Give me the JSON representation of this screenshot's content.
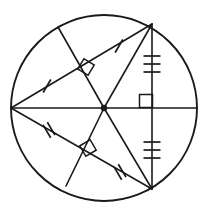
{
  "figure": {
    "type": "geometry-diagram",
    "width": 207,
    "height": 216,
    "background_color": "#ffffff",
    "stroke_color": "#1a1a1a"
  },
  "circle": {
    "name": "main-circle",
    "center_x": 104,
    "center_y": 108,
    "radius": 93,
    "label": "circle"
  },
  "center_point": {
    "name": "center-dot",
    "x": 104,
    "y": 108,
    "radius": 3.2,
    "label": "center"
  },
  "points": {
    "left": {
      "x": 11,
      "y": 108,
      "label": "left-vertex"
    },
    "right": {
      "x": 197,
      "y": 108,
      "label": "right-vertex"
    },
    "top": {
      "x": 152,
      "y": 24,
      "label": "top-vertex"
    },
    "bottom": {
      "x": 152,
      "y": 189,
      "label": "bottom-vertex"
    },
    "upper_perp_end": {
      "x": 58,
      "y": 27,
      "label": "upper-perpendicular-endpoint"
    },
    "lower_perp_end": {
      "x": 66,
      "y": 186,
      "label": "lower-perpendicular-endpoint"
    },
    "upper_foot": {
      "x": 86,
      "y": 67,
      "label": "upper-perpendicular-foot"
    },
    "lower_foot": {
      "x": 88,
      "y": 148,
      "label": "lower-perpendicular-foot"
    }
  },
  "segments": [
    {
      "name": "horizontal-diameter",
      "x1": 11,
      "y1": 108,
      "x2": 197,
      "y2": 108,
      "label": "horizontal diameter"
    },
    {
      "name": "vertical-chord",
      "x1": 152,
      "y1": 24,
      "x2": 152,
      "y2": 189,
      "label": "vertical chord"
    },
    {
      "name": "upper-chord",
      "x1": 11,
      "y1": 108,
      "x2": 152,
      "y2": 24,
      "label": "upper chord"
    },
    {
      "name": "lower-chord",
      "x1": 11,
      "y1": 108,
      "x2": 152,
      "y2": 189,
      "label": "lower chord"
    },
    {
      "name": "center-to-top-radius",
      "x1": 104,
      "y1": 108,
      "x2": 152,
      "y2": 24,
      "label": "radius to top vertex"
    },
    {
      "name": "center-to-bottom-radius",
      "x1": 104,
      "y1": 108,
      "x2": 152,
      "y2": 189,
      "label": "radius to bottom vertex"
    },
    {
      "name": "upper-perpendicular",
      "x1": 58,
      "y1": 27,
      "x2": 104,
      "y2": 108,
      "label": "upper perpendicular bisector"
    },
    {
      "name": "lower-perpendicular",
      "x1": 66,
      "y1": 186,
      "x2": 104,
      "y2": 108,
      "label": "lower perpendicular bisector"
    }
  ],
  "right_angle_marks": [
    {
      "name": "right-angle-center",
      "cx": 146,
      "cy": 101,
      "size": 13,
      "rotation": 0,
      "label": "right angle at center on vertical chord"
    },
    {
      "name": "right-angle-upper-foot",
      "cx": 86,
      "cy": 67,
      "size": 12,
      "rotation": 30.8,
      "label": "right angle at upper chord foot"
    },
    {
      "name": "right-angle-lower-foot",
      "cx": 88,
      "cy": 148,
      "size": 12,
      "rotation": -30.5,
      "label": "right angle at lower chord foot"
    }
  ],
  "tick_marks": [
    {
      "name": "tick-vertical-upper",
      "count": 3,
      "x": 152,
      "y": 64,
      "angle": 90,
      "length": 17,
      "spacing": 8,
      "label": "three ticks upper vertical chord half"
    },
    {
      "name": "tick-vertical-lower",
      "count": 3,
      "x": 152,
      "y": 150,
      "angle": 90,
      "length": 17,
      "spacing": 8,
      "label": "three ticks lower vertical chord half"
    },
    {
      "name": "tick-upper-chord-left",
      "count": 1,
      "x": 47,
      "y": 86,
      "angle": 30.8,
      "length": 15,
      "spacing": 5,
      "label": "single tick upper chord left half"
    },
    {
      "name": "tick-upper-chord-right",
      "count": 1,
      "x": 119,
      "y": 46,
      "angle": 30.8,
      "length": 15,
      "spacing": 5,
      "label": "single tick upper chord right half"
    },
    {
      "name": "tick-lower-chord-left",
      "count": 2,
      "x": 49,
      "y": 130,
      "angle": -30.5,
      "length": 15,
      "spacing": 5,
      "label": "double tick lower chord left half"
    },
    {
      "name": "tick-lower-chord-right",
      "count": 2,
      "x": 120,
      "y": 172,
      "angle": -30.5,
      "length": 15,
      "spacing": 5,
      "label": "double tick lower chord right half"
    }
  ]
}
